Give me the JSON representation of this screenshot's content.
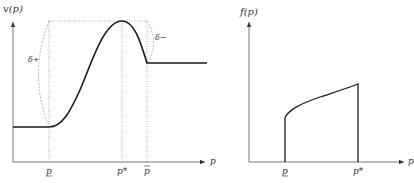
{
  "left_plot": {
    "y_axis_label": "v(p)",
    "x_axis_label": "p",
    "ticks": [
      {
        "label": "p",
        "decoration": "underbar",
        "name": "p-lower"
      },
      {
        "label": "p*",
        "name": "p-star"
      },
      {
        "label": "p",
        "decoration": "overbar",
        "name": "p-upper"
      }
    ],
    "annotations": {
      "delta_plus": "δ+",
      "delta_minus": "δ−"
    }
  },
  "right_plot": {
    "y_axis_label": "f(p)",
    "x_axis_label": "p",
    "ticks": [
      {
        "label": "p",
        "decoration": "underbar",
        "name": "p-lower"
      },
      {
        "label": "p*",
        "name": "p-star"
      }
    ]
  },
  "colors": {
    "axis": "#555555",
    "curve": "#1a1a1a",
    "dotted": "#888888",
    "text": "#333333"
  }
}
